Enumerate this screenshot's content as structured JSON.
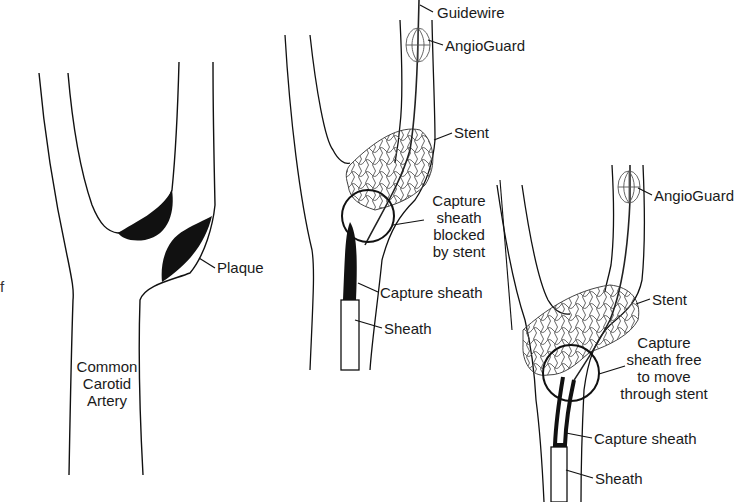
{
  "figure": {
    "panels": [
      {
        "id": "panel-1",
        "description": "Carotid bifurcation with plaque",
        "labels": {
          "plaque": "Plaque",
          "common_carotid_line1": "Common",
          "common_carotid_line2": "Carotid",
          "common_carotid_line3": "Artery"
        }
      },
      {
        "id": "panel-2",
        "description": "Capture sheath blocked by stent",
        "labels": {
          "guidewire": "Guidewire",
          "angioguard": "AngioGuard",
          "stent": "Stent",
          "callout_line1": "Capture",
          "callout_line2": "sheath",
          "callout_line3": "blocked",
          "callout_line4": "by stent",
          "capture_sheath": "Capture sheath",
          "sheath": "Sheath"
        }
      },
      {
        "id": "panel-3",
        "description": "Capture sheath free to move through stent",
        "labels": {
          "angioguard": "AngioGuard",
          "stent": "Stent",
          "callout_line1": "Capture",
          "callout_line2": "sheath free",
          "callout_line3": "to move",
          "callout_line4": "through stent",
          "capture_sheath": "Capture sheath",
          "sheath": "Sheath"
        }
      }
    ],
    "edge_fragment": "f"
  }
}
